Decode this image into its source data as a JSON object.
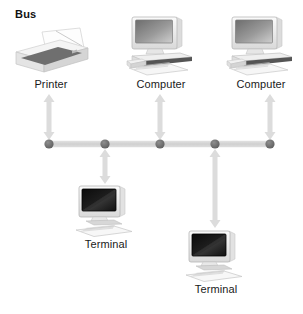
{
  "diagram": {
    "title": "Bus",
    "topology_type": "bus",
    "accent_colors": {
      "bus_line": "#d2d2d2",
      "node_dot": "#6b6b6b",
      "arrow": "#dcdcdc",
      "label_text": "#1a1a1a",
      "screen_dark": "#111111",
      "screen_gray": "#8a8a8a",
      "device_body": "#e9e9e9"
    },
    "bus": {
      "y": 144,
      "x_start": 49,
      "x_end": 270,
      "node_count": 5,
      "node_x": [
        49,
        105,
        160,
        215,
        270
      ]
    },
    "devices": [
      {
        "id": "printer",
        "label": "Printer",
        "icon": "printer-icon",
        "position": "above",
        "node_index": 0,
        "x": 12,
        "y": 26,
        "w": 78,
        "h": 48,
        "label_x": 12,
        "label_y": 78,
        "label_w": 78,
        "arrow": {
          "x": 49,
          "y_top": 94,
          "y_bottom": 140,
          "heads": "both"
        }
      },
      {
        "id": "computer-1",
        "label": "Computer",
        "icon": "desktop-computer-icon",
        "position": "above",
        "node_index": 2,
        "x": 126,
        "y": 16,
        "w": 70,
        "h": 60,
        "label_x": 120,
        "label_y": 78,
        "label_w": 82,
        "arrow": {
          "x": 160,
          "y_top": 94,
          "y_bottom": 140,
          "heads": "both"
        }
      },
      {
        "id": "computer-2",
        "label": "Computer",
        "icon": "desktop-computer-icon",
        "position": "above",
        "node_index": 4,
        "x": 226,
        "y": 16,
        "w": 70,
        "h": 60,
        "label_x": 220,
        "label_y": 78,
        "label_w": 82,
        "arrow": {
          "x": 270,
          "y_top": 94,
          "y_bottom": 140,
          "heads": "both"
        }
      },
      {
        "id": "terminal-1",
        "label": "Terminal",
        "icon": "terminal-icon",
        "position": "below",
        "node_index": 1,
        "x": 74,
        "y": 185,
        "w": 64,
        "h": 52,
        "label_x": 70,
        "label_y": 238,
        "label_w": 72,
        "arrow": {
          "x": 105,
          "y_top": 149,
          "y_bottom": 184,
          "heads": "both"
        }
      },
      {
        "id": "terminal-2",
        "label": "Terminal",
        "icon": "terminal-icon",
        "position": "below",
        "node_index": 3,
        "x": 184,
        "y": 230,
        "w": 64,
        "h": 52,
        "label_x": 180,
        "label_y": 283,
        "label_w": 72,
        "arrow": {
          "x": 215,
          "y_top": 149,
          "y_bottom": 228,
          "heads": "both"
        }
      }
    ]
  }
}
